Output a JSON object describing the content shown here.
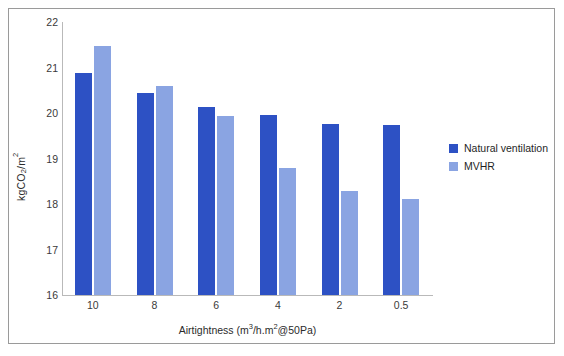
{
  "chart_data": {
    "type": "bar",
    "title": "",
    "subtitle": "",
    "xlabel": "Airtightness (m³/h.m²@50Pa)",
    "ylabel": "kgCO₂/m²",
    "categories": [
      "10",
      "8",
      "6",
      "4",
      "2",
      "0.5"
    ],
    "series": [
      {
        "name": "Natural ventilation",
        "color": "#2d51c4",
        "values": [
          20.87,
          20.43,
          20.13,
          19.95,
          19.76,
          19.73
        ]
      },
      {
        "name": "MVHR",
        "color": "#8aa4e2",
        "values": [
          21.48,
          20.6,
          19.93,
          18.8,
          18.29,
          18.11
        ]
      }
    ],
    "ylim": [
      16,
      22
    ],
    "yticks": [
      "16",
      "17",
      "18",
      "19",
      "20",
      "21",
      "22"
    ],
    "grid": false,
    "legend_position": "right",
    "annotations": []
  },
  "legend": {
    "items": [
      {
        "label": "Natural ventilation",
        "color": "#2d51c4"
      },
      {
        "label": "MVHR",
        "color": "#8aa4e2"
      }
    ]
  },
  "axes": {
    "y_title": "kgCO₂/m²",
    "x_title": "Airtightness (m³/h.m²@50Pa)"
  },
  "colors": {
    "series_natural_ventilation": "#2d51c4",
    "series_mvhr": "#8aa4e2",
    "axis_line": "#b9b9b9",
    "frame_border": "#9a9a9a",
    "background": "#ffffff",
    "tick_text": "#3a3a3a"
  }
}
